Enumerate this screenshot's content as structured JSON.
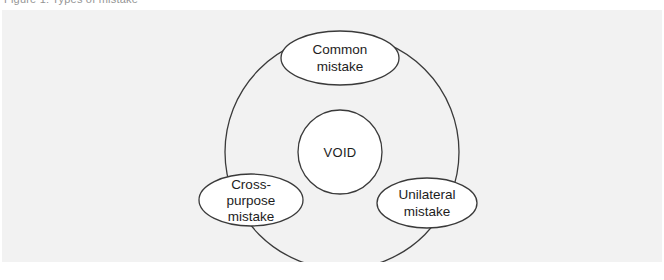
{
  "caption": {
    "text": "Figure 1:  Types of mistake"
  },
  "figure": {
    "background_color": "#f2f2f2",
    "stroke_color": "#3a3a3a",
    "node_fill_color": "#ffffff",
    "text_color": "#1d1d1d"
  },
  "diagram": {
    "type": "venn-ring",
    "center_node": {
      "id": "void",
      "label": "VOID"
    },
    "outer_ring": {
      "id": "outer-circle",
      "center": [
        340,
        142
      ],
      "radius": 117
    },
    "nodes": [
      {
        "id": "common-mistake",
        "label_lines": [
          "Common",
          "mistake"
        ],
        "center": [
          338,
          48
        ],
        "rx": 59,
        "ry": 27
      },
      {
        "id": "cross-purpose-mistake",
        "label_lines": [
          "Cross-",
          "purpose",
          "mistake"
        ],
        "center": [
          249,
          190
        ],
        "rx": 52,
        "ry": 26
      },
      {
        "id": "unilateral-mistake",
        "label_lines": [
          "Unilateral",
          "mistake"
        ],
        "center": [
          425,
          193
        ],
        "rx": 50,
        "ry": 25
      }
    ]
  }
}
